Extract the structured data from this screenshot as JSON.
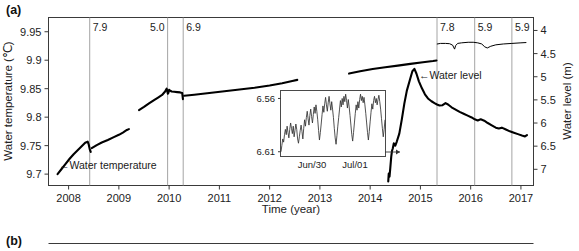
{
  "figure": {
    "panel_a_label": "(a)",
    "panel_b_label": "(b)"
  },
  "chart_data": {
    "type": "line",
    "title": "",
    "xlabel": "Time (year)",
    "ylabel": "Water temperature (℃)",
    "y2label": "Water level (m)",
    "xlim": [
      2007.6,
      2017.25
    ],
    "ylim": [
      9.68,
      9.975
    ],
    "y2lim": [
      7.35,
      3.72
    ],
    "y2_inverted": true,
    "grid": false,
    "xticks": [
      2008,
      2009,
      2010,
      2011,
      2012,
      2013,
      2014,
      2015,
      2016,
      2017
    ],
    "xticklabels": [
      "2008",
      "2009",
      "2010",
      "2011",
      "2012",
      "2013",
      "2014",
      "2015",
      "2016",
      "2017"
    ],
    "yticks": [
      9.7,
      9.75,
      9.8,
      9.85,
      9.9,
      9.95
    ],
    "yticklabels": [
      "9.7",
      "9.75",
      "9.8",
      "9.85",
      "9.9",
      "9.95"
    ],
    "y2ticks": [
      4,
      4.5,
      5,
      5.5,
      6,
      6.5,
      7
    ],
    "y2ticklabels": [
      "4",
      "4.5",
      "5",
      "5.5",
      "6",
      "6.5",
      "7"
    ],
    "annotations": [
      {
        "label": "7.9",
        "x": 2008.42,
        "align": "right"
      },
      {
        "label": "5.0",
        "x": 2009.97,
        "align": "left"
      },
      {
        "label": "6.9",
        "x": 2010.28,
        "align": "right"
      },
      {
        "label": "7.8",
        "x": 2015.33,
        "align": "right"
      },
      {
        "label": "5.9",
        "x": 2016.08,
        "align": "right"
      },
      {
        "label": "5.9",
        "x": 2016.82,
        "align": "right"
      }
    ],
    "series": [
      {
        "name": "Water temperature",
        "axis": "left",
        "label_text": "←Water temperature",
        "label_x": 2008.05,
        "label_y": 9.702,
        "segments": [
          {
            "comment": "2007.75-2008.47 rising then sawtooth drop",
            "points": [
              [
                2007.78,
                9.7
              ],
              [
                2007.86,
                9.709
              ],
              [
                2007.94,
                9.718
              ],
              [
                2008.02,
                9.727
              ],
              [
                2008.1,
                9.735
              ],
              [
                2008.18,
                9.742
              ],
              [
                2008.26,
                9.749
              ],
              [
                2008.33,
                9.755
              ],
              [
                2008.38,
                9.757
              ],
              [
                2008.4,
                9.752
              ],
              [
                2008.42,
                9.744
              ],
              [
                2008.44,
                9.739
              ]
            ]
          },
          {
            "comment": "2008.46-2009.18 steady rise to 9.778",
            "points": [
              [
                2008.46,
                9.7455
              ],
              [
                2008.56,
                9.751
              ],
              [
                2008.66,
                9.7555
              ],
              [
                2008.78,
                9.76
              ],
              [
                2008.9,
                9.765
              ],
              [
                2009.0,
                9.769
              ],
              [
                2009.08,
                9.773
              ],
              [
                2009.16,
                9.7775
              ],
              [
                2009.2,
                9.779
              ]
            ]
          },
          {
            "comment": "2009.38-2009.95 segment rising to local peak",
            "points": [
              [
                2009.4,
                9.8125
              ],
              [
                2009.5,
                9.818
              ],
              [
                2009.6,
                9.824
              ],
              [
                2009.7,
                9.83
              ],
              [
                2009.78,
                9.8345
              ],
              [
                2009.86,
                9.839
              ],
              [
                2009.92,
                9.845
              ],
              [
                2009.95,
                9.85
              ],
              [
                2009.965,
                9.8455
              ],
              [
                2009.975,
                9.841
              ]
            ]
          },
          {
            "comment": "small rebound spike near 2010.0",
            "points": [
              [
                2009.985,
                9.8425
              ],
              [
                2010.0,
                9.848
              ],
              [
                2010.02,
                9.8465
              ],
              [
                2010.05,
                9.845
              ],
              [
                2010.1,
                9.8445
              ],
              [
                2010.16,
                9.844
              ],
              [
                2010.22,
                9.8435
              ],
              [
                2010.26,
                9.8425
              ],
              [
                2010.275,
                9.8315
              ]
            ]
          },
          {
            "comment": "2010.3-2012.55 long slow rise",
            "points": [
              [
                2010.3,
                9.8375
              ],
              [
                2010.5,
                9.8395
              ],
              [
                2010.8,
                9.8425
              ],
              [
                2011.1,
                9.8455
              ],
              [
                2011.4,
                9.8485
              ],
              [
                2011.7,
                9.8515
              ],
              [
                2012.0,
                9.8555
              ],
              [
                2012.25,
                9.8595
              ],
              [
                2012.45,
                9.8635
              ],
              [
                2012.55,
                9.8655
              ]
            ]
          },
          {
            "comment": "2013.55-2015.33 segment rising",
            "points": [
              [
                2013.58,
                9.8765
              ],
              [
                2013.8,
                9.8805
              ],
              [
                2014.05,
                9.8845
              ],
              [
                2014.3,
                9.8875
              ],
              [
                2014.55,
                9.8905
              ],
              [
                2014.8,
                9.8935
              ],
              [
                2015.05,
                9.8965
              ],
              [
                2015.25,
                9.8985
              ],
              [
                2015.32,
                9.8995
              ]
            ]
          },
          {
            "comment": "2015.33-2017.1 upper plateau with two dips",
            "points": [
              [
                2015.335,
                9.9285
              ],
              [
                2015.4,
                9.9295
              ],
              [
                2015.5,
                9.9295
              ],
              [
                2015.58,
                9.929
              ],
              [
                2015.64,
                9.9265
              ],
              [
                2015.68,
                9.9195
              ],
              [
                2015.7,
                9.9255
              ],
              [
                2015.74,
                9.9295
              ],
              [
                2015.82,
                9.9305
              ],
              [
                2015.95,
                9.9315
              ],
              [
                2016.05,
                9.9315
              ],
              [
                2016.14,
                9.9305
              ],
              [
                2016.22,
                9.9285
              ],
              [
                2016.28,
                9.9235
              ],
              [
                2016.33,
                9.9215
              ],
              [
                2016.4,
                9.9245
              ],
              [
                2016.5,
                9.927
              ],
              [
                2016.65,
                9.9285
              ],
              [
                2016.82,
                9.9295
              ],
              [
                2017.0,
                9.9305
              ],
              [
                2017.1,
                9.931
              ]
            ]
          }
        ]
      },
      {
        "name": "Water level",
        "axis": "right",
        "label_text": "←Water level",
        "label_x": 2015.02,
        "label_y2": 5.02,
        "segments": [
          {
            "comment": "deep low then sharp rise to peak 2014.85",
            "points": [
              [
                2014.36,
                7.26
              ],
              [
                2014.37,
                7.09
              ],
              [
                2014.385,
                7.16
              ],
              [
                2014.4,
                6.98
              ],
              [
                2014.42,
                6.72
              ],
              [
                2014.435,
                6.6
              ],
              [
                2014.45,
                6.55
              ],
              [
                2014.47,
                6.44
              ],
              [
                2014.5,
                6.49
              ],
              [
                2014.53,
                6.4
              ],
              [
                2014.58,
                6.23
              ],
              [
                2014.63,
                5.92
              ],
              [
                2014.68,
                5.58
              ],
              [
                2014.73,
                5.3
              ],
              [
                2014.79,
                5.07
              ],
              [
                2014.84,
                4.88
              ],
              [
                2014.88,
                4.83
              ],
              [
                2014.92,
                4.93
              ],
              [
                2014.97,
                5.1
              ],
              [
                2015.03,
                5.25
              ],
              [
                2015.09,
                5.38
              ],
              [
                2015.15,
                5.47
              ],
              [
                2015.22,
                5.53
              ],
              [
                2015.28,
                5.57
              ],
              [
                2015.33,
                5.6
              ],
              [
                2015.38,
                5.62
              ],
              [
                2015.44,
                5.615
              ],
              [
                2015.5,
                5.57
              ],
              [
                2015.55,
                5.6
              ],
              [
                2015.62,
                5.66
              ],
              [
                2015.7,
                5.71
              ],
              [
                2015.78,
                5.76
              ],
              [
                2015.86,
                5.8
              ],
              [
                2015.94,
                5.84
              ],
              [
                2016.02,
                5.88
              ],
              [
                2016.08,
                5.92
              ],
              [
                2016.14,
                5.945
              ],
              [
                2016.2,
                5.92
              ],
              [
                2016.27,
                5.95
              ],
              [
                2016.34,
                6.0
              ],
              [
                2016.42,
                6.05
              ],
              [
                2016.5,
                6.1
              ],
              [
                2016.56,
                6.12
              ],
              [
                2016.62,
                6.1
              ],
              [
                2016.7,
                6.14
              ],
              [
                2016.78,
                6.18
              ],
              [
                2016.86,
                6.21
              ],
              [
                2016.94,
                6.24
              ],
              [
                2017.02,
                6.27
              ],
              [
                2017.08,
                6.29
              ],
              [
                2017.12,
                6.26
              ]
            ]
          }
        ]
      }
    ],
    "inset": {
      "yticks": [
        6.56,
        6.61
      ],
      "yticklabels": [
        "6.56",
        "6.61"
      ],
      "xticklabels": [
        "Jun/30",
        "Jul/01"
      ],
      "ylabel": "",
      "xlabel": "",
      "comment": "zoomed high-frequency water level oscillations over ~2 days",
      "values": [
        6.61,
        6.604,
        6.598,
        6.601,
        6.594,
        6.589,
        6.594,
        6.586,
        6.592,
        6.597,
        6.589,
        6.583,
        6.588,
        6.593,
        6.586,
        6.596,
        6.59,
        6.584,
        6.589,
        6.598,
        6.602,
        6.596,
        6.59,
        6.585,
        6.591,
        6.598,
        6.588,
        6.58,
        6.586,
        6.578,
        6.572,
        6.579,
        6.585,
        6.576,
        6.57,
        6.577,
        6.583,
        6.575,
        6.568,
        6.574,
        6.566,
        6.572,
        6.58,
        6.59,
        6.599,
        6.592,
        6.584,
        6.575,
        6.567,
        6.573,
        6.565,
        6.559,
        6.566,
        6.572,
        6.564,
        6.558,
        6.565,
        6.571,
        6.563,
        6.57,
        6.578,
        6.588,
        6.597,
        6.603,
        6.595,
        6.586,
        6.578,
        6.57,
        6.562,
        6.568,
        6.56,
        6.566,
        6.558,
        6.563,
        6.556,
        6.562,
        6.569,
        6.561,
        6.568,
        6.576,
        6.585,
        6.594,
        6.6,
        6.592,
        6.583,
        6.574,
        6.566,
        6.571,
        6.563,
        6.569,
        6.561,
        6.556,
        6.562,
        6.558,
        6.564,
        6.559,
        6.566,
        6.574,
        6.583,
        6.592,
        6.599,
        6.591,
        6.582,
        6.573,
        6.565,
        6.57,
        6.562,
        6.558,
        6.564,
        6.56,
        6.566,
        6.561,
        6.557,
        6.563,
        6.57,
        6.579,
        6.588,
        6.596,
        6.589,
        6.58
      ]
    }
  }
}
